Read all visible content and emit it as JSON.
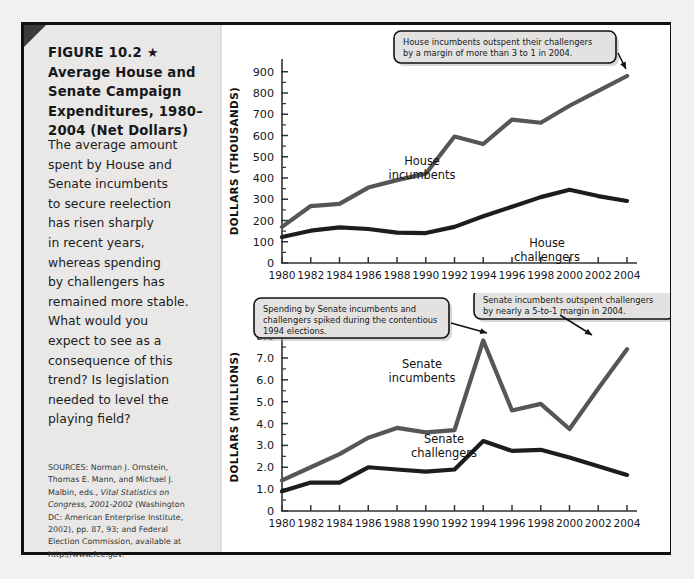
{
  "figure": {
    "title_lines": [
      "FIGURE 10.2 ★",
      "Average House and",
      "Senate Campaign",
      "Expenditures, 1980–",
      "2004 (Net Dollars)"
    ],
    "body_lines": [
      "The average amount",
      "spent by House and",
      "Senate incumbents",
      "to secure reelection",
      "has risen sharply",
      "in recent years,",
      "whereas spending",
      "by challengers has",
      "remained more stable.",
      "What would you",
      "expect to see as a",
      "consequence of this",
      "trend? Is legislation",
      "needed to level the",
      "playing field?"
    ],
    "sources_lines": [
      "SOURCES: Norman J. Ornstein,",
      "Thomas E. Mann, and Michael J.",
      "Malbin, eds., Vital Statistics on",
      "Congress, 2001-2002 (Washington",
      "DC: American Enterprise Institute,",
      "2002), pp. 87, 93; and Federal",
      "Election Commission, available at",
      "http://www.fec.gov."
    ],
    "star_glyph": "★"
  },
  "colors": {
    "incumbent_line": "#565656",
    "challenger_line": "#1d1d1d",
    "axis": "#333333",
    "panel_bg": "#e9e8e6",
    "page_bg": "#ffffff",
    "frame": "#111111",
    "callout_bg": "#e3e2e0"
  },
  "chart_data": [
    {
      "id": "house",
      "type": "line",
      "title": "",
      "xlabel": "",
      "ylabel": "DOLLARS (THOUSANDS)",
      "x": [
        1980,
        1982,
        1984,
        1986,
        1988,
        1990,
        1992,
        1994,
        1996,
        1998,
        2000,
        2002,
        2004
      ],
      "xtick_labels": [
        "1980",
        "1982",
        "1984",
        "1986",
        "1988",
        "1990",
        "1992",
        "1994",
        "1996",
        "1998",
        "2000",
        "2002",
        "2004"
      ],
      "ytick_labels": [
        "0",
        "100",
        "200",
        "300",
        "400",
        "500",
        "600",
        "700",
        "800",
        "900"
      ],
      "ytick_values": [
        0,
        100,
        200,
        300,
        400,
        500,
        600,
        700,
        800,
        900
      ],
      "ylim": [
        0,
        960
      ],
      "xlim": [
        1980,
        2004
      ],
      "grid": false,
      "legend": "inline-labels",
      "series": [
        {
          "name": "House incumbents",
          "label_lines": [
            "House",
            "incumbents"
          ],
          "color": "#565656",
          "values": [
            170,
            268,
            278,
            355,
            390,
            420,
            595,
            560,
            675,
            660,
            740,
            810,
            880
          ]
        },
        {
          "name": "House challengers",
          "label_lines": [
            "House",
            "challengers"
          ],
          "color": "#1d1d1d",
          "values": [
            122,
            152,
            168,
            160,
            143,
            141,
            170,
            220,
            265,
            310,
            345,
            315,
            292
          ]
        }
      ],
      "annotations": [
        {
          "name": "house-callout",
          "lines": [
            "House incumbents outspent their challengers",
            "by a margin of more than 3 to 1 in 2004."
          ],
          "points_to_year": 2004
        }
      ]
    },
    {
      "id": "senate",
      "type": "line",
      "title": "",
      "xlabel": "",
      "ylabel": "DOLLARS (MILLIONS)",
      "x": [
        1980,
        1982,
        1984,
        1986,
        1988,
        1990,
        1992,
        1994,
        1996,
        1998,
        2000,
        2002,
        2004
      ],
      "xtick_labels": [
        "1980",
        "1982",
        "1984",
        "1986",
        "1988",
        "1990",
        "1992",
        "1994",
        "1996",
        "1998",
        "2000",
        "2002",
        "2004"
      ],
      "ytick_labels": [
        "0",
        "1.0",
        "2.0",
        "3.0",
        "4.0",
        "5.0",
        "6.0",
        "7.0",
        "8.0"
      ],
      "ytick_values": [
        0,
        1,
        2,
        3,
        4,
        5,
        6,
        7,
        8
      ],
      "ylim": [
        0,
        8.6
      ],
      "xlim": [
        1980,
        2004
      ],
      "grid": false,
      "legend": "inline-labels",
      "series": [
        {
          "name": "Senate incumbents",
          "label_lines": [
            "Senate",
            "incumbents"
          ],
          "color": "#565656",
          "values": [
            1.4,
            2.0,
            2.6,
            3.35,
            3.8,
            3.6,
            3.7,
            7.8,
            4.6,
            4.9,
            3.75,
            5.6,
            7.4
          ]
        },
        {
          "name": "Senate challengers",
          "label_lines": [
            "Senate",
            "challengers"
          ],
          "color": "#1d1d1d",
          "values": [
            0.9,
            1.3,
            1.3,
            2.0,
            1.9,
            1.8,
            1.9,
            3.2,
            2.75,
            2.8,
            2.45,
            2.05,
            1.65
          ]
        }
      ],
      "annotations": [
        {
          "name": "senate-callout-left",
          "lines": [
            "Spending by Senate incumbents and",
            "challengers spiked during the contentious",
            "1994 elections."
          ],
          "points_to_year": 1994
        },
        {
          "name": "senate-callout-right",
          "lines": [
            "Senate incumbents outspent challengers",
            "by nearly a 5-to-1 margin in 2004."
          ],
          "points_to_year": 2004
        }
      ]
    }
  ]
}
